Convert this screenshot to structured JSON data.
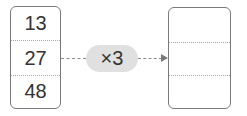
{
  "input_list": {
    "values": [
      "13",
      "27",
      "48"
    ]
  },
  "operation": {
    "label": "×3"
  },
  "output_list": {
    "values": [
      "",
      "",
      ""
    ]
  },
  "colors": {
    "border": "#7a7a7a",
    "pill_fill": "#e0e0e0",
    "text": "#333333",
    "connector": "#8a8a8a"
  }
}
